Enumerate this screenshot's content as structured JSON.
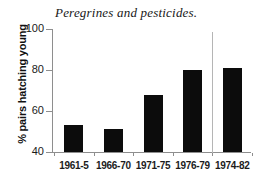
{
  "chart_data": {
    "type": "bar",
    "title": "Peregrines and pesticides.",
    "xlabel": "",
    "ylabel": "% pairs hatching young",
    "categories": [
      "1961-5",
      "1966-70",
      "1971-75",
      "1976-79",
      "1974-82"
    ],
    "values": [
      53,
      51,
      68,
      80,
      81
    ],
    "ylim": [
      40,
      100
    ],
    "yticks": [
      40,
      60,
      80,
      100
    ],
    "ytick_labels": [
      "40",
      "60",
      "80",
      "100"
    ],
    "grid": false,
    "legend": null,
    "annotations": [
      {
        "name": "group-separator",
        "type": "vertical-line",
        "between_categories": [
          "1976-79",
          "1974-82"
        ]
      }
    ],
    "colors": {
      "bar": "#0c0c0c",
      "axis": "#8e8e8e",
      "text": "#1a1a1a",
      "background": "#ffffff",
      "separator": "#b5b5b5"
    }
  }
}
